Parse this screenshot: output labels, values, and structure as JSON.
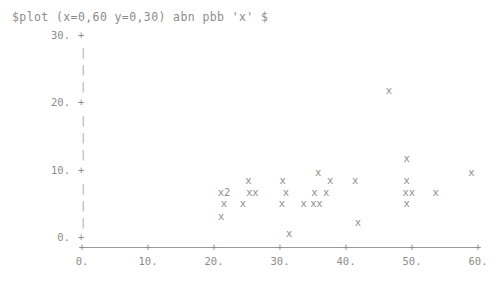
{
  "command": {
    "text": "$plot (x=0,60 y=0,30) abn pbb 'x' $"
  },
  "colors": {
    "ink": "#8c8c8c",
    "axis": "#9a9a9a",
    "dash": "#a8a8a8",
    "background": "#ffffff"
  },
  "axes": {
    "y": {
      "label": "",
      "min": 0,
      "max": 30,
      "tick_values": [
        30,
        20,
        10,
        0
      ],
      "tick_labels": [
        "30.",
        "20.",
        "10.",
        "0."
      ],
      "tick_glyph": "+",
      "dash_glyph": "|",
      "style": "dashed"
    },
    "x": {
      "label": "",
      "min": 0,
      "max": 60,
      "tick_values": [
        0,
        10,
        20,
        30,
        40,
        50,
        60
      ],
      "tick_labels": [
        "0.",
        "10.",
        "20.",
        "30.",
        "40.",
        "50.",
        "60."
      ],
      "tick_glyph": "+",
      "style": "solid"
    }
  },
  "marker": {
    "glyph": "x",
    "overplot_suffix_note": "digit after glyph = count of coincident points"
  },
  "chart_data": {
    "type": "scatter",
    "title": "$plot (x=0,60 y=0,30) abn pbb 'x' $",
    "xlabel": "",
    "ylabel": "",
    "xlim": [
      0,
      60
    ],
    "ylim": [
      0,
      30
    ],
    "grid": false,
    "legend": null,
    "marker_symbol": "x",
    "points": [
      {
        "x": 25.2,
        "y": 8.4,
        "glyph": "x",
        "count": 1
      },
      {
        "x": 21.5,
        "y": 6.7,
        "glyph": "x2",
        "count": 2
      },
      {
        "x": 25.8,
        "y": 6.7,
        "glyph": "xx",
        "count": 2
      },
      {
        "x": 21.5,
        "y": 5.0,
        "glyph": "x",
        "count": 1
      },
      {
        "x": 24.4,
        "y": 5.0,
        "glyph": "x",
        "count": 1
      },
      {
        "x": 21.1,
        "y": 3.1,
        "glyph": "x",
        "count": 1
      },
      {
        "x": 31.4,
        "y": 0.6,
        "glyph": "x",
        "count": 1
      },
      {
        "x": 30.4,
        "y": 8.4,
        "glyph": "x",
        "count": 1
      },
      {
        "x": 30.9,
        "y": 6.7,
        "glyph": "x",
        "count": 1
      },
      {
        "x": 30.3,
        "y": 5.0,
        "glyph": "x",
        "count": 1
      },
      {
        "x": 33.6,
        "y": 5.0,
        "glyph": "x",
        "count": 1
      },
      {
        "x": 35.8,
        "y": 9.6,
        "glyph": "x",
        "count": 1
      },
      {
        "x": 35.2,
        "y": 6.7,
        "glyph": "x",
        "count": 1
      },
      {
        "x": 37.0,
        "y": 6.7,
        "glyph": "x",
        "count": 1
      },
      {
        "x": 35.5,
        "y": 5.0,
        "glyph": "xx",
        "count": 2
      },
      {
        "x": 37.6,
        "y": 8.4,
        "glyph": "x",
        "count": 1
      },
      {
        "x": 41.8,
        "y": 2.2,
        "glyph": "x",
        "count": 1
      },
      {
        "x": 46.5,
        "y": 21.8,
        "glyph": "x",
        "count": 1
      },
      {
        "x": 41.4,
        "y": 8.4,
        "glyph": "x",
        "count": 1
      },
      {
        "x": 49.2,
        "y": 11.7,
        "glyph": "x",
        "count": 1
      },
      {
        "x": 49.2,
        "y": 8.4,
        "glyph": "x",
        "count": 1
      },
      {
        "x": 49.5,
        "y": 6.7,
        "glyph": "xx",
        "count": 2
      },
      {
        "x": 49.2,
        "y": 5.0,
        "glyph": "x",
        "count": 1
      },
      {
        "x": 53.6,
        "y": 6.7,
        "glyph": "x",
        "count": 1
      },
      {
        "x": 59.0,
        "y": 9.6,
        "glyph": "x",
        "count": 1
      }
    ]
  }
}
